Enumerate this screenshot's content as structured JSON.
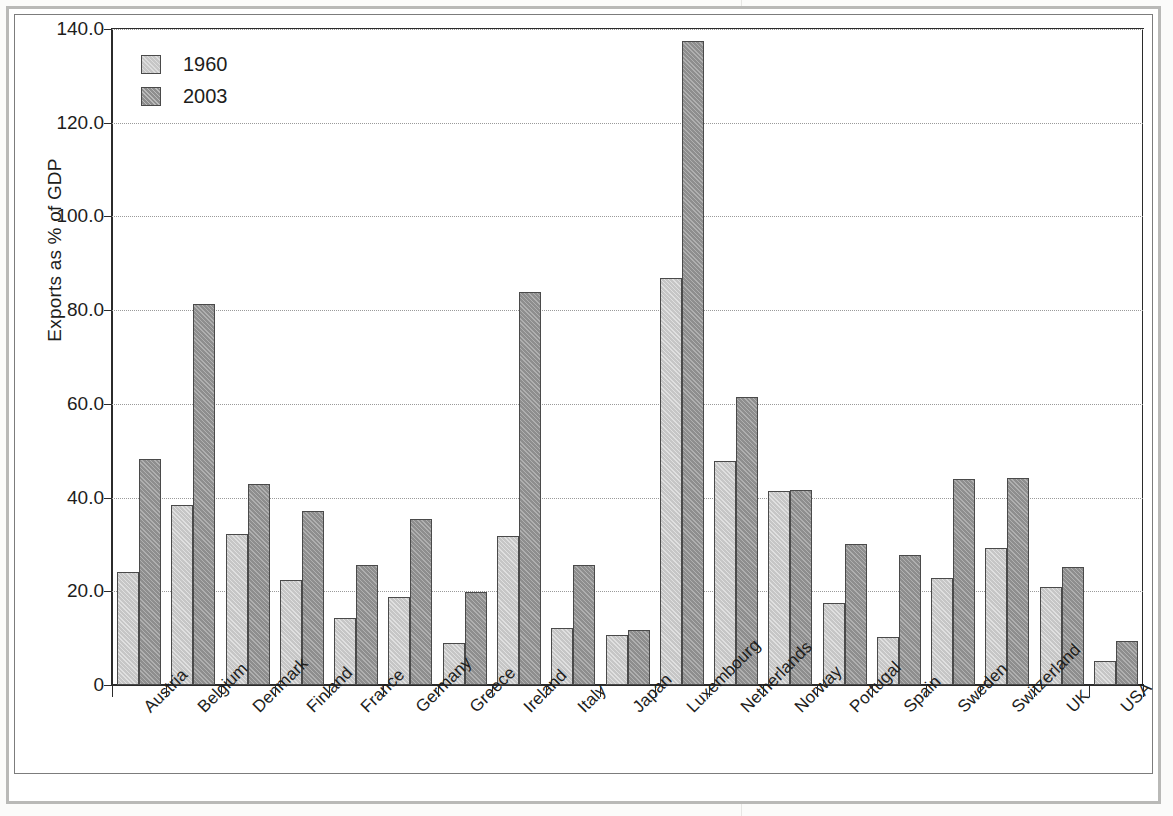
{
  "figure": {
    "ylabel": "Exports as % of GDP"
  },
  "legend": {
    "items": [
      {
        "label": "1960",
        "color": "#c6c6c6",
        "name": "legend-item-1960"
      },
      {
        "label": "2003",
        "color": "#8e8e8e",
        "name": "legend-item-2003"
      }
    ]
  },
  "axis": {
    "y_ticks": [
      "0",
      "20.0",
      "40.0",
      "60.0",
      "80.0",
      "100.0",
      "120.0",
      "140.0"
    ]
  },
  "chart_data": {
    "type": "bar",
    "title": "",
    "xlabel": "",
    "ylabel": "Exports as % of GDP",
    "ylim": [
      0,
      140
    ],
    "yticks": [
      0,
      20,
      40,
      60,
      80,
      100,
      120,
      140
    ],
    "ytick_labels": [
      "0",
      "20.0",
      "40.0",
      "60.0",
      "80.0",
      "100.0",
      "120.0",
      "140.0"
    ],
    "grid": true,
    "legend_position": "upper-left",
    "categories": [
      "Austria",
      "Belgium",
      "Denmark",
      "Finland",
      "France",
      "Germany",
      "Greece",
      "Ireland",
      "Italy",
      "Japan",
      "Luxembourg",
      "Netherlands",
      "Norway",
      "Portugal",
      "Spain",
      "Sweden",
      "Switzerland",
      "UK",
      "USA"
    ],
    "series": [
      {
        "name": "1960",
        "color": "#c6c6c6",
        "values": [
          24.1,
          38.4,
          32.2,
          22.4,
          14.4,
          18.8,
          9.0,
          31.8,
          12.1,
          10.7,
          86.8,
          47.8,
          41.3,
          17.5,
          10.2,
          22.8,
          29.2,
          20.9,
          5.1
        ]
      },
      {
        "name": "2003",
        "color": "#8e8e8e",
        "values": [
          48.3,
          81.3,
          42.8,
          37.1,
          25.6,
          35.4,
          19.8,
          83.9,
          25.6,
          11.7,
          137.4,
          61.5,
          41.6,
          30.2,
          27.7,
          43.9,
          44.1,
          25.2,
          9.4
        ]
      }
    ]
  }
}
